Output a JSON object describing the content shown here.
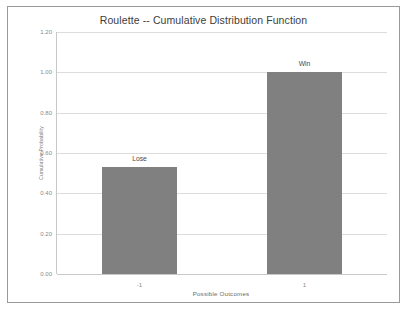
{
  "chart_data": {
    "type": "bar",
    "title": "Roulette -- Cumulative Distribution Function",
    "xlabel": "Possible Outcomes",
    "ylabel": "Cumulative Probability",
    "categories": [
      "-1",
      "1"
    ],
    "values": [
      0.53,
      1.0
    ],
    "point_labels": [
      "Lose",
      "Win"
    ],
    "ylim": [
      0.0,
      1.2
    ],
    "yticks": [
      "0.00",
      "0.20",
      "0.40",
      "0.60",
      "0.80",
      "1.00",
      "1.20"
    ],
    "ytick_values": [
      0.0,
      0.2,
      0.4,
      0.6,
      0.8,
      1.0,
      1.2
    ],
    "grid": true,
    "legend": "none",
    "bar_color": "#808080",
    "gridline_color": "#dcdcdc",
    "background_color": "#ffffff",
    "border_color": "#9a9a9a"
  }
}
